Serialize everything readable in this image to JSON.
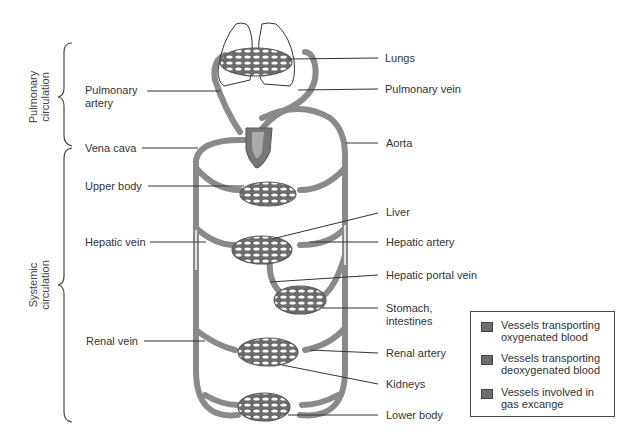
{
  "diagram": {
    "title": "",
    "regions": {
      "pulmonary": {
        "line1": "Pulmonary",
        "line2": "circulation"
      },
      "systemic": {
        "line1": "Systemic",
        "line2": "circulation"
      }
    },
    "labels_left": {
      "pulmonary_artery": {
        "line1": "Pulmonary",
        "line2": "artery"
      },
      "vena_cava": "Vena cava",
      "upper_body": "Upper body",
      "hepatic_vein": "Hepatic vein",
      "renal_vein": "Renal vein"
    },
    "labels_right": {
      "lungs": "Lungs",
      "pulmonary_vein": "Pulmonary vein",
      "aorta": "Aorta",
      "liver": "Liver",
      "hepatic_artery": "Hepatic artery",
      "hepatic_portal_vein": "Hepatic portal vein",
      "stomach": {
        "line1": "Stomach,",
        "line2": "intestines"
      },
      "renal_artery": "Renal artery",
      "kidneys": "Kidneys",
      "lower_body": "Lower body"
    },
    "legend": {
      "items": [
        {
          "label": "Vessels transporting oxygenated blood",
          "color": "#6e6e6e"
        },
        {
          "label": "Vessels transporting deoxygenated blood",
          "color": "#7a7a7a"
        },
        {
          "label": "Vessels involved in gas excange",
          "color": "#666666"
        }
      ]
    },
    "colors": {
      "vessel": "#8a8a8a",
      "vessel_dark": "#5a5a5a",
      "leader_line": "#333333",
      "heart": "#777777"
    }
  }
}
